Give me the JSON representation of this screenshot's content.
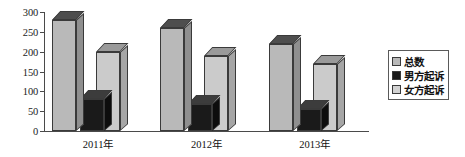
{
  "chart_data": {
    "type": "bar",
    "title": "",
    "subtitle": "",
    "xlabel": "",
    "ylabel": "",
    "categories": [
      "2011年",
      "2012年",
      "2013年"
    ],
    "series": [
      {
        "name": "总数",
        "values": [
          280,
          260,
          220
        ],
        "color": "#b9b9b9"
      },
      {
        "name": "男方起诉",
        "values": [
          80,
          68,
          55
        ],
        "color": "#1a1a1a"
      },
      {
        "name": "女方起诉",
        "values": [
          200,
          188,
          170
        ],
        "color": "#cbcbcb"
      }
    ],
    "ylim": [
      0,
      300
    ],
    "yticks": [
      0,
      50,
      100,
      150,
      200,
      250,
      300
    ],
    "ytick_labels": [
      "0",
      "50",
      "100",
      "150",
      "200",
      "250",
      "300"
    ],
    "grid": false,
    "legend_position": "right",
    "three_d": true
  },
  "legend": {
    "items": [
      {
        "label": "总数",
        "swatch": "total-swatch"
      },
      {
        "label": "男方起诉",
        "swatch": "male-swatch"
      },
      {
        "label": "女方起诉",
        "swatch": "female-swatch"
      }
    ]
  }
}
